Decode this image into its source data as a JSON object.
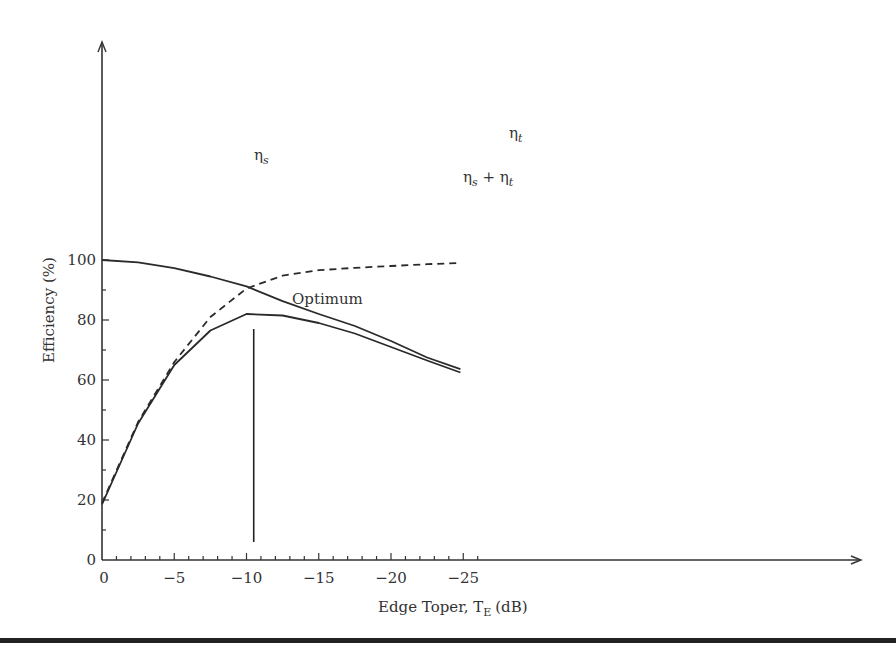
{
  "chart_data": {
    "type": "line",
    "title": "",
    "xlabel": "Edge Toper, T_E (dB)",
    "xlabel_main": "Edge Toper, T",
    "xlabel_sub": "E",
    "xlabel_unit": "(dB)",
    "ylabel": "Efficiency (%)",
    "xlim": [
      0,
      -26.5
    ],
    "ylim": [
      0,
      103
    ],
    "grid": false,
    "legend": "inline labels",
    "x_ticks": [
      0,
      -5,
      -10,
      -15,
      -20,
      -25
    ],
    "x_tick_labels": [
      "0",
      "−5",
      "−10",
      "−15",
      "−20",
      "−25"
    ],
    "x_minor_step": 1,
    "y_ticks": [
      0,
      20,
      40,
      60,
      80,
      100
    ],
    "y_tick_labels": [
      "0",
      "20",
      "40",
      "60",
      "80",
      "100"
    ],
    "y_minor_step": 10,
    "x_origin_label": "0",
    "series": [
      {
        "name": "ηt",
        "label_main": "η",
        "label_sub": "t",
        "style": "solid",
        "x": [
          0,
          -2.5,
          -5,
          -7.5,
          -10,
          -12.5,
          -15,
          -17.5,
          -20,
          -22.5,
          -24.8
        ],
        "values": [
          100,
          99.2,
          97.3,
          94.5,
          91.2,
          86.3,
          82,
          78,
          73,
          67.5,
          63.6
        ]
      },
      {
        "name": "ηs",
        "label_main": "η",
        "label_sub": "s",
        "style": "dashed",
        "x": [
          0,
          -2.5,
          -5,
          -7.5,
          -10,
          -12.5,
          -15,
          -17.5,
          -20,
          -22.5,
          -24.8
        ],
        "values": [
          19,
          46,
          66,
          81,
          90.5,
          94.8,
          96.6,
          97.4,
          98,
          98.6,
          99
        ]
      },
      {
        "name": "ηs + ηt",
        "label_main": "η",
        "label_sub": "s",
        "label_plus": " + η",
        "label_sub2": "t",
        "style": "solid",
        "x": [
          0,
          -2.5,
          -5,
          -7.5,
          -10,
          -12.5,
          -15,
          -17.5,
          -20,
          -22.5,
          -24.8
        ],
        "values": [
          18.5,
          45.5,
          65,
          76.5,
          82,
          81.5,
          79,
          75.5,
          71,
          66.5,
          62.5
        ]
      }
    ],
    "annotations": [
      {
        "text": "Optimum",
        "type": "vertical-line",
        "x": -10.5,
        "y_from": 6,
        "y_to": 77
      }
    ]
  }
}
